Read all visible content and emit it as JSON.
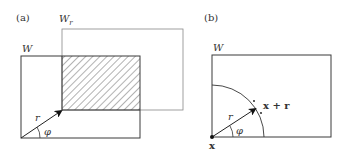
{
  "panel_a": {
    "label": "(a)",
    "window_label": "W",
    "shifted_window_label_main": "W",
    "shifted_window_label_sub": "r",
    "vector_label": "r",
    "angle_label": "φ"
  },
  "panel_b": {
    "label": "(b)",
    "window_label": "W",
    "origin_label": "x",
    "endpoint_label": "x + r",
    "vector_label": "r",
    "angle_label": "φ"
  },
  "colors": {
    "line": "#3a3a3a",
    "dotted": "#777777",
    "hatch": "#555555"
  }
}
